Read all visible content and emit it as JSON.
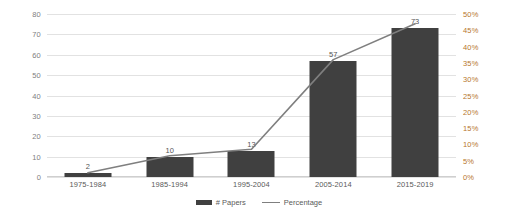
{
  "chart_data": {
    "type": "bar",
    "title": "",
    "xlabel": "",
    "ylabel": "",
    "categories": [
      "1975-1984",
      "1985-1994",
      "1995-2004",
      "2005-2014",
      "2015-2019"
    ],
    "series": [
      {
        "name": "# Papers",
        "type": "bar",
        "axis": "left",
        "values": [
          2,
          10,
          13,
          57,
          73
        ],
        "labels": [
          "2",
          "10",
          "13",
          "57",
          "73"
        ],
        "color": "#404040"
      },
      {
        "name": "Percentage",
        "type": "line",
        "axis": "right",
        "values": [
          1.3,
          6.5,
          8.5,
          36.0,
          47.0
        ],
        "color": "#7f7f7f"
      }
    ],
    "ylim": [
      0,
      80
    ],
    "y_ticks": [
      0,
      10,
      20,
      30,
      40,
      50,
      60,
      70,
      80
    ],
    "y_tick_labels": [
      "0",
      "10",
      "20",
      "30",
      "40",
      "50",
      "60",
      "70",
      "80"
    ],
    "y2lim": [
      0,
      50
    ],
    "y2_ticks": [
      0,
      5,
      10,
      15,
      20,
      25,
      30,
      35,
      40,
      45,
      50
    ],
    "y2_tick_labels": [
      "0%",
      "5%",
      "10%",
      "15%",
      "20%",
      "25%",
      "30%",
      "35%",
      "40%",
      "45%",
      "50%"
    ],
    "grid": true,
    "legend_position": "bottom",
    "legend": [
      "# Papers",
      "Percentage"
    ]
  },
  "legend": {
    "papers_label": "# Papers",
    "percentage_label": "Percentage"
  },
  "colors": {
    "bar": "#404040",
    "line": "#7f7f7f",
    "left_axis_text": "#808080",
    "right_axis_text": "#b7762c",
    "gridline": "#e2e2e2"
  }
}
